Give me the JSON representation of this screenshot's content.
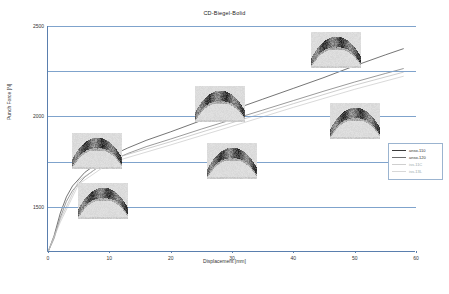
{
  "chart": {
    "title": "CD-Biegel-Bolid",
    "xlabel": "Displacement [mm]",
    "ylabel": "Punch Force [N]"
  },
  "chart_data": {
    "type": "line",
    "title": "CD-Biegel-Bolid",
    "xlabel": "Displacement [mm]",
    "ylabel": "Punch Force [N]",
    "xlim": [
      0,
      60
    ],
    "ylim": [
      0,
      2500
    ],
    "xticks": [
      0,
      10,
      20,
      30,
      40,
      50,
      60
    ],
    "yticks": [
      0,
      500,
      1000,
      1500,
      2000,
      2500
    ],
    "ytick_labels": [
      "0",
      "500",
      "1000",
      "1500",
      "2000",
      "2500"
    ],
    "grid": "horizontal",
    "legend_position": "right-inside",
    "series": [
      {
        "name": "anso-110",
        "color": "#3a3a3a",
        "x": [
          0,
          1,
          2,
          3,
          4,
          6,
          8,
          10,
          13,
          16,
          20,
          25,
          30,
          35,
          40,
          45,
          50,
          55,
          58
        ],
        "y": [
          0,
          180,
          430,
          610,
          730,
          880,
          980,
          1055,
          1150,
          1235,
          1330,
          1455,
          1570,
          1690,
          1810,
          1930,
          2060,
          2180,
          2250
        ]
      },
      {
        "name": "anso-120",
        "color": "#6e6e6e",
        "x": [
          0,
          1,
          2,
          3,
          4,
          6,
          8,
          10,
          13,
          16,
          20,
          25,
          30,
          35,
          40,
          45,
          50,
          55,
          58
        ],
        "y": [
          0,
          150,
          380,
          560,
          680,
          830,
          930,
          1000,
          1090,
          1165,
          1250,
          1360,
          1465,
          1570,
          1675,
          1780,
          1880,
          1975,
          2030
        ]
      },
      {
        "name": "iss-11C",
        "color": "#b9b9b9",
        "x": [
          0,
          2,
          5,
          10,
          20,
          30,
          40,
          50,
          58
        ],
        "y": [
          0,
          360,
          790,
          1020,
          1220,
          1430,
          1640,
          1845,
          1990
        ]
      },
      {
        "name": "iss-13L",
        "color": "#c9c9c9",
        "x": [
          0,
          2,
          5,
          10,
          20,
          30,
          40,
          50,
          58
        ],
        "y": [
          0,
          330,
          750,
          985,
          1185,
          1390,
          1600,
          1800,
          1945
        ]
      }
    ],
    "legend": [
      {
        "label": "anso-110",
        "color": "#3a3a3a"
      },
      {
        "label": "anso-120",
        "color": "#6e6e6e"
      },
      {
        "label": "iss-11C",
        "color": "#b9b9b9"
      },
      {
        "label": "iss-13L",
        "color": "#c9c9c9"
      }
    ],
    "annotations": [
      {
        "name": "specimen-thumb-1",
        "x": 8,
        "y": 1120,
        "caption": ""
      },
      {
        "name": "specimen-thumb-2",
        "x": 9,
        "y": 560,
        "caption": ""
      },
      {
        "name": "specimen-thumb-3",
        "x": 28,
        "y": 1640,
        "caption": ""
      },
      {
        "name": "specimen-thumb-4",
        "x": 30,
        "y": 1010,
        "caption": ""
      },
      {
        "name": "specimen-thumb-5",
        "x": 47,
        "y": 2240,
        "caption": ""
      },
      {
        "name": "specimen-thumb-6",
        "x": 50,
        "y": 1450,
        "caption": ""
      }
    ]
  }
}
